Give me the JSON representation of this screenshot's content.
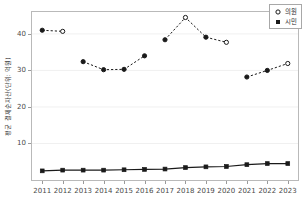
{
  "chart_data": {
    "type": "line",
    "title": "",
    "xlabel": "",
    "ylabel": "평균 결제순자산(단위: 억원)",
    "x": [
      2011,
      2012,
      2013,
      2014,
      2015,
      2016,
      2017,
      2018,
      2019,
      2020,
      2021,
      2022,
      2023
    ],
    "xtick_labels": [
      "2011",
      "2012",
      "2013",
      "2014",
      "2015",
      "2016",
      "2017",
      "2018",
      "2019",
      "2020",
      "2021",
      "2022",
      "2023"
    ],
    "ytick_labels": [
      "10",
      "20",
      "30",
      "40"
    ],
    "ytick_values": [
      10,
      20,
      30,
      40
    ],
    "ylim": [
      0,
      46
    ],
    "xlim": [
      2010.5,
      2023.5
    ],
    "grid": false,
    "legend_position": "top-right",
    "series": [
      {
        "name": "의원",
        "style": "dashed",
        "marker": "circle",
        "color": "#1a1a1a",
        "segments": [
          {
            "x": [
              2011,
              2012
            ],
            "values": [
              41.0,
              40.7
            ]
          },
          {
            "x": [
              2013,
              2014,
              2015,
              2016
            ],
            "values": [
              32.4,
              30.2,
              30.3,
              34.0
            ]
          },
          {
            "x": [
              2017,
              2018,
              2019,
              2020
            ],
            "values": [
              38.4,
              44.5,
              39.1,
              37.7
            ]
          },
          {
            "x": [
              2021,
              2022,
              2023
            ],
            "values": [
              28.2,
              30.0,
              31.9
            ]
          }
        ],
        "values": [
          41.0,
          40.7,
          32.4,
          30.2,
          30.3,
          34.0,
          38.4,
          44.5,
          39.1,
          37.7,
          28.2,
          30.0,
          31.9
        ],
        "open_marker_points": [
          2012,
          2018,
          2020,
          2023
        ]
      },
      {
        "name": "시민",
        "style": "solid",
        "marker": "square",
        "color": "#1a1a1a",
        "segments": [
          {
            "x": [
              2011,
              2012,
              2013,
              2014,
              2015,
              2016,
              2017,
              2018,
              2019,
              2020,
              2021,
              2022,
              2023
            ],
            "values": [
              2.5,
              2.7,
              2.7,
              2.7,
              2.8,
              2.9,
              3.0,
              3.4,
              3.6,
              3.7,
              4.2,
              4.5,
              4.5
            ]
          }
        ],
        "values": [
          2.5,
          2.7,
          2.7,
          2.7,
          2.8,
          2.9,
          3.0,
          3.4,
          3.6,
          3.7,
          4.2,
          4.5,
          4.5
        ]
      }
    ],
    "legend": [
      {
        "label": "의원",
        "marker": "open-circle"
      },
      {
        "label": "시민",
        "marker": "filled-square"
      }
    ]
  }
}
